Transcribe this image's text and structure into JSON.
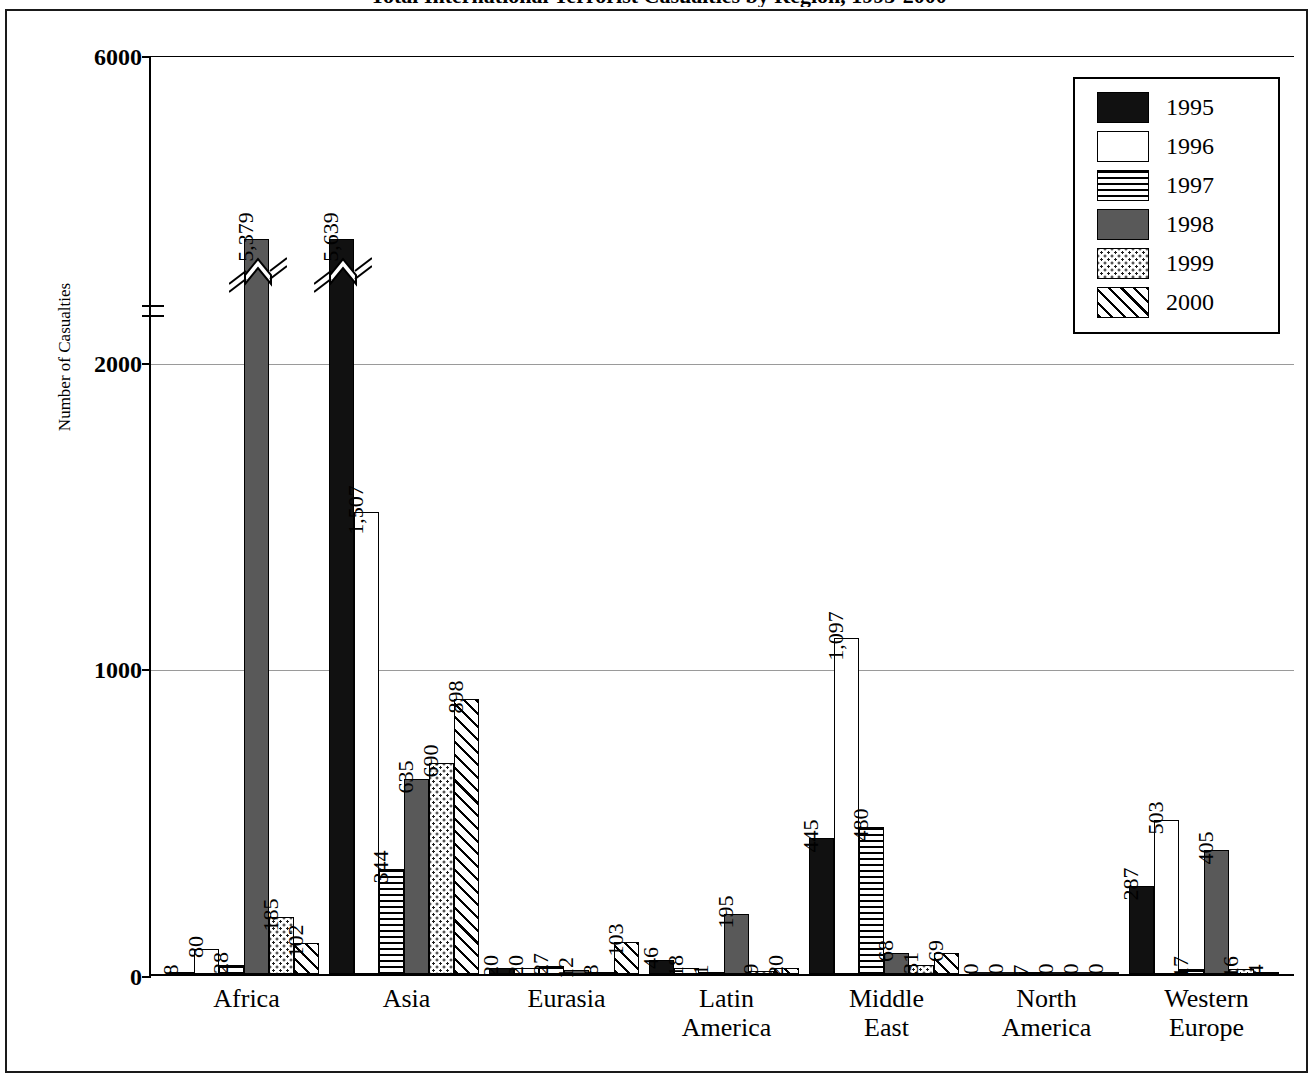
{
  "chart_data": {
    "type": "bar",
    "title": "Total International Terrorist Casualties by Region, 1995-2000",
    "subtitle": "",
    "xlabel": "",
    "ylabel": "Number of Casualties",
    "ylim": [
      0,
      6000
    ],
    "yticks": [
      "0",
      "1000",
      "2000",
      "6000"
    ],
    "grid": "horizontal gridlines at 1000 and 2000",
    "axis_break": "y-axis broken between 2000 and 6000",
    "legend_position": "top-right",
    "categories": [
      "Africa",
      "Asia",
      "Eurasia",
      "Latin\nAmerica",
      "Middle\nEast",
      "North\nAmerica",
      "Western\nEurope"
    ],
    "series": [
      {
        "name": "1995",
        "pattern": "solid-black",
        "values": [
          8,
          5639,
          20,
          46,
          445,
          0,
          287
        ]
      },
      {
        "name": "1996",
        "pattern": "white",
        "values": [
          80,
          1507,
          20,
          18,
          1097,
          0,
          503
        ]
      },
      {
        "name": "1997",
        "pattern": "horizontal-lines",
        "values": [
          28,
          344,
          27,
          1,
          480,
          7,
          17
        ]
      },
      {
        "name": "1998",
        "pattern": "dark-gray",
        "values": [
          5379,
          635,
          12,
          195,
          68,
          0,
          405
        ]
      },
      {
        "name": "1999",
        "pattern": "dots",
        "values": [
          185,
          690,
          8,
          9,
          31,
          0,
          16
        ]
      },
      {
        "name": "2000",
        "pattern": "diagonal-hatch",
        "values": [
          102,
          898,
          103,
          20,
          69,
          0,
          4
        ]
      }
    ],
    "data_labels": [
      {
        "category": "Africa",
        "labels": [
          "8",
          "80",
          "28",
          "5,379",
          "185",
          "102"
        ]
      },
      {
        "category": "Asia",
        "labels": [
          "5,639",
          "1,507",
          "344",
          "635",
          "690",
          "898"
        ]
      },
      {
        "category": "Eurasia",
        "labels": [
          "20",
          "20",
          "27",
          "12",
          "8",
          "103"
        ]
      },
      {
        "category": "Latin America",
        "labels": [
          "46",
          "18",
          "1",
          "195",
          "9",
          "20"
        ]
      },
      {
        "category": "Middle East",
        "labels": [
          "445",
          "1,097",
          "480",
          "68",
          "31",
          "69"
        ]
      },
      {
        "category": "North America",
        "labels": [
          "0",
          "0",
          "7",
          "0",
          "0",
          "0"
        ]
      },
      {
        "category": "Western Europe",
        "labels": [
          "287",
          "503",
          "17",
          "405",
          "16",
          "4"
        ]
      }
    ],
    "broken_bars": [
      {
        "category": "Africa",
        "series": "1998",
        "value": 5379
      },
      {
        "category": "Asia",
        "series": "1995",
        "value": 5639
      }
    ],
    "colors": {
      "axis": "#000000",
      "gridline": "#9a9a9a",
      "series_1995": "#111111",
      "series_1996": "#ffffff",
      "series_1998": "#595959",
      "frame": "#1a1a1a"
    }
  },
  "legend": {
    "items": [
      {
        "label": "1995"
      },
      {
        "label": "1996"
      },
      {
        "label": "1997"
      },
      {
        "label": "1998"
      },
      {
        "label": "1999"
      },
      {
        "label": "2000"
      }
    ]
  },
  "yaxis": {
    "label": "Number of Casualties",
    "ticks": [
      {
        "text": "6000"
      },
      {
        "text": "2000"
      },
      {
        "text": "1000"
      },
      {
        "text": "0"
      }
    ]
  }
}
